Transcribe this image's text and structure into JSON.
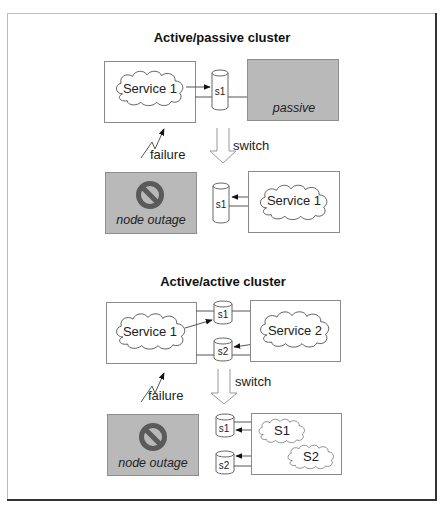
{
  "diagram": {
    "frame": {
      "stroke": "#444444",
      "background": "#ffffff"
    },
    "sections": [
      {
        "title": "Active/passive cluster",
        "before": {
          "left_node": {
            "kind": "active",
            "service": "Service 1"
          },
          "storage": [
            "s1"
          ],
          "right_node": {
            "kind": "passive",
            "label": "passive"
          }
        },
        "failure_label": "failure",
        "switch_label": "switch",
        "after": {
          "left_node": {
            "kind": "outage",
            "label": "node outage",
            "icon": "prohibited-icon"
          },
          "storage": [
            "s1"
          ],
          "right_node": {
            "kind": "active",
            "service": "Service 1"
          }
        }
      },
      {
        "title": "Active/active cluster",
        "before": {
          "left_node": {
            "kind": "active",
            "service": "Service 1"
          },
          "storage": [
            "s1",
            "s2"
          ],
          "right_node": {
            "kind": "active",
            "service": "Service 2"
          }
        },
        "failure_label": "failure",
        "switch_label": "switch",
        "after": {
          "left_node": {
            "kind": "outage",
            "label": "node outage",
            "icon": "prohibited-icon"
          },
          "storage": [
            "s1",
            "s2"
          ],
          "right_node": {
            "kind": "active",
            "services": [
              "S1",
              "S2"
            ]
          }
        }
      }
    ],
    "colors": {
      "passive_fill": "#b9b9b9",
      "outage_fill": "#b9b9b9",
      "prohibited_icon": "#5a5a5a",
      "node_border": "#8a8a8a"
    }
  }
}
